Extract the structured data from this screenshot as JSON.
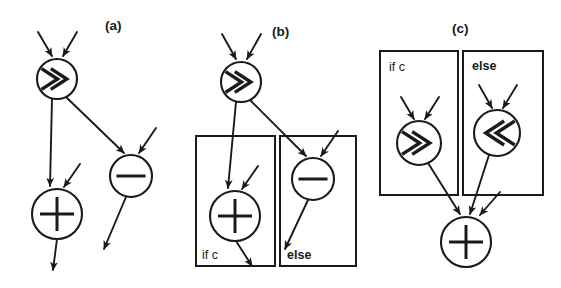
{
  "figure": {
    "caption_panels": [
      "(a)",
      "(b)",
      "(c)"
    ],
    "background_color": "#ffffff",
    "ink_color": "#1a1a1a",
    "width": 561,
    "height": 288
  },
  "panels": [
    {
      "id": "a",
      "label": "(a)",
      "label_x": 105,
      "label_y": 30,
      "description": "unpredicated dataflow graph",
      "nodes": [
        {
          "id": "a-shr",
          "op": ">>",
          "glyph": "right-shift",
          "cx": 57,
          "cy": 79,
          "r": 20
        },
        {
          "id": "a-sub",
          "op": "-",
          "glyph": "minus",
          "cx": 131,
          "cy": 176,
          "r": 21
        },
        {
          "id": "a-add",
          "op": "+",
          "glyph": "plus",
          "cx": 57,
          "cy": 214,
          "r": 25
        }
      ],
      "regions": []
    },
    {
      "id": "b",
      "label": "(b)",
      "label_x": 272,
      "label_y": 36,
      "description": "predicated regions guarding the same operations",
      "nodes": [
        {
          "id": "b-shr",
          "op": ">>",
          "glyph": "right-shift",
          "cx": 241,
          "cy": 82,
          "r": 20
        },
        {
          "id": "b-sub",
          "op": "-",
          "glyph": "minus",
          "cx": 313,
          "cy": 179,
          "r": 21
        },
        {
          "id": "b-add",
          "op": "+",
          "glyph": "plus",
          "cx": 235,
          "cy": 216,
          "r": 25
        }
      ],
      "regions": [
        {
          "id": "b-if",
          "label": "if c",
          "bold": false,
          "x": 196,
          "y": 136,
          "w": 79,
          "h": 130,
          "label_x": 202,
          "label_y": 259
        },
        {
          "id": "b-else",
          "label": "else",
          "bold": true,
          "x": 280,
          "y": 136,
          "w": 76,
          "h": 130,
          "label_x": 287,
          "label_y": 259
        }
      ]
    },
    {
      "id": "c",
      "label": "(c)",
      "label_x": 452,
      "label_y": 33,
      "description": "predicated regions feeding a common add node",
      "nodes": [
        {
          "id": "c-shr",
          "op": ">>",
          "glyph": "right-shift",
          "cx": 419,
          "cy": 143,
          "r": 22
        },
        {
          "id": "c-shl",
          "op": "<<",
          "glyph": "left-shift",
          "cx": 497,
          "cy": 133,
          "r": 23
        },
        {
          "id": "c-add",
          "op": "+",
          "glyph": "plus",
          "cx": 466,
          "cy": 242,
          "r": 25
        }
      ],
      "regions": [
        {
          "id": "c-if",
          "label": "if c",
          "bold": false,
          "x": 380,
          "y": 51,
          "w": 78,
          "h": 144,
          "label_x": 389,
          "label_y": 71
        },
        {
          "id": "c-else",
          "label": "else",
          "bold": true,
          "x": 463,
          "y": 51,
          "w": 80,
          "h": 144,
          "label_x": 472,
          "label_y": 70
        }
      ]
    }
  ],
  "edges": [
    {
      "panel": "a",
      "id": "a-in-shr-left",
      "x1": 38,
      "y1": 32,
      "x2": 52,
      "y2": 56,
      "arrow": true
    },
    {
      "panel": "a",
      "id": "a-in-shr-right",
      "x1": 77,
      "y1": 32,
      "x2": 63,
      "y2": 56,
      "arrow": true
    },
    {
      "panel": "a",
      "id": "a-shr-to-add",
      "x1": 52,
      "y1": 99,
      "x2": 50,
      "y2": 186,
      "arrow": true
    },
    {
      "panel": "a",
      "id": "a-shr-to-sub",
      "x1": 66,
      "y1": 97,
      "x2": 124,
      "y2": 153,
      "arrow": true
    },
    {
      "panel": "a",
      "id": "a-in-sub-right",
      "x1": 156,
      "y1": 128,
      "x2": 139,
      "y2": 153,
      "arrow": true
    },
    {
      "panel": "a",
      "id": "a-in-add-right",
      "x1": 80,
      "y1": 164,
      "x2": 64,
      "y2": 187,
      "arrow": true
    },
    {
      "panel": "a",
      "id": "a-add-out",
      "x1": 57,
      "y1": 239,
      "x2": 53,
      "y2": 270,
      "arrow": true
    },
    {
      "panel": "a",
      "id": "a-sub-out",
      "x1": 126,
      "y1": 197,
      "x2": 104,
      "y2": 249,
      "arrow": true
    },
    {
      "panel": "b",
      "id": "b-in-shr-left",
      "x1": 222,
      "y1": 34,
      "x2": 236,
      "y2": 59,
      "arrow": true
    },
    {
      "panel": "b",
      "id": "b-in-shr-right",
      "x1": 261,
      "y1": 34,
      "x2": 247,
      "y2": 59,
      "arrow": true
    },
    {
      "panel": "b",
      "id": "b-shr-to-add",
      "x1": 236,
      "y1": 102,
      "x2": 228,
      "y2": 188,
      "arrow": true
    },
    {
      "panel": "b",
      "id": "b-shr-to-sub",
      "x1": 250,
      "y1": 100,
      "x2": 306,
      "y2": 156,
      "arrow": true
    },
    {
      "panel": "b",
      "id": "b-in-sub-right",
      "x1": 338,
      "y1": 131,
      "x2": 321,
      "y2": 156,
      "arrow": true
    },
    {
      "panel": "b",
      "id": "b-in-add-right",
      "x1": 258,
      "y1": 166,
      "x2": 242,
      "y2": 189,
      "arrow": true
    },
    {
      "panel": "b",
      "id": "b-add-out",
      "x1": 236,
      "y1": 241,
      "x2": 252,
      "y2": 266,
      "arrow": true
    },
    {
      "panel": "b",
      "id": "b-sub-out",
      "x1": 308,
      "y1": 200,
      "x2": 285,
      "y2": 249,
      "arrow": true
    },
    {
      "panel": "c",
      "id": "c-in-shr-left",
      "x1": 401,
      "y1": 97,
      "x2": 414,
      "y2": 119,
      "arrow": true
    },
    {
      "panel": "c",
      "id": "c-in-shr-right",
      "x1": 439,
      "y1": 97,
      "x2": 425,
      "y2": 119,
      "arrow": true
    },
    {
      "panel": "c",
      "id": "c-in-shl-left",
      "x1": 479,
      "y1": 85,
      "x2": 492,
      "y2": 108,
      "arrow": true
    },
    {
      "panel": "c",
      "id": "c-in-shl-right",
      "x1": 517,
      "y1": 85,
      "x2": 503,
      "y2": 108,
      "arrow": true
    },
    {
      "panel": "c",
      "id": "c-shr-to-add",
      "x1": 428,
      "y1": 163,
      "x2": 460,
      "y2": 214,
      "arrow": true
    },
    {
      "panel": "c",
      "id": "c-shl-to-add",
      "x1": 489,
      "y1": 155,
      "x2": 470,
      "y2": 214,
      "arrow": true
    },
    {
      "panel": "c",
      "id": "c-in-add-right",
      "x1": 500,
      "y1": 192,
      "x2": 480,
      "y2": 215,
      "arrow": true
    }
  ]
}
